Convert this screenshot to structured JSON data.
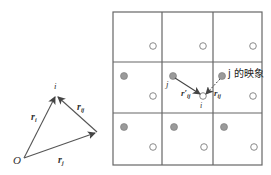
{
  "colors": {
    "line": "#555555",
    "grid": "#666666",
    "filled_dot": "#9a9a9a",
    "filled_dot_stroke": "#777777",
    "open_circle": "#8a8a8a",
    "text": "#333333"
  },
  "left_diagram": {
    "points": {
      "O": {
        "label": "O",
        "x": 24,
        "y": 158
      },
      "i": {
        "label": "i",
        "x": 56,
        "y": 95
      },
      "j": {
        "label": "",
        "x": 97,
        "y": 132
      }
    },
    "vectors": [
      {
        "name": "r_i",
        "label": "r",
        "subscript": "i",
        "from": "O",
        "to": "i"
      },
      {
        "name": "r_j",
        "label": "r",
        "subscript": "j",
        "from": "O",
        "to": "j"
      },
      {
        "name": "r_ij",
        "label": "r",
        "subscript": "ij",
        "from": "j",
        "to": "i"
      }
    ]
  },
  "right_diagram": {
    "grid": {
      "rows": 3,
      "cols": 3,
      "left": 113,
      "top": 12,
      "col_width": 50,
      "row_height": 51
    },
    "open_circles_label": "",
    "center_cell": {
      "j_label": "j",
      "i_label": "i",
      "r_prime_label": "r′",
      "r_prime_subscript": "ij",
      "r_label": "r",
      "r_subscript": "ij",
      "image_label": "j 的映象"
    }
  }
}
